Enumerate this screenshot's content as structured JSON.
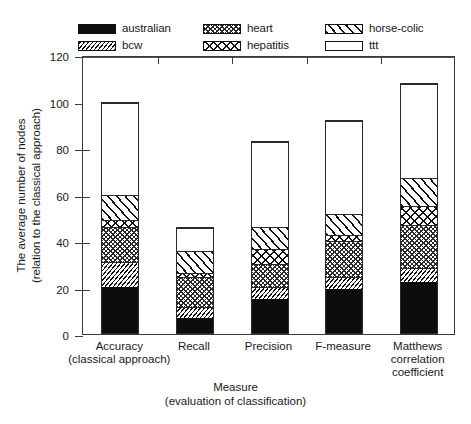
{
  "chart_data": {
    "type": "bar",
    "subtype": "stacked-bar",
    "title": "",
    "xlabel": "Measure (evaluation of classification)",
    "xlabel_lines": [
      "Measure",
      "(evaluation of classification)"
    ],
    "ylabel": "The average number of nodes (relation to the classical approach)",
    "ylabel_lines": [
      "The average number of nodes",
      "(relation to the classical approach)"
    ],
    "ylim": [
      0,
      120
    ],
    "yticks": [
      0,
      20,
      40,
      60,
      80,
      100,
      120
    ],
    "ytick_labels": [
      "0",
      "20",
      "40",
      "60",
      "80",
      "100",
      "120"
    ],
    "grid": false,
    "reference_line": 100,
    "legend_position": "above-plot",
    "categories": [
      "Accuracy (classical approach)",
      "Recall",
      "Precision",
      "F-measure",
      "Matthews correlation coefficient"
    ],
    "category_lines": [
      [
        "Accuracy",
        "(classical approach)"
      ],
      [
        "Recall"
      ],
      [
        "Precision"
      ],
      [
        "F-measure"
      ],
      [
        "Matthews",
        "correlation",
        "coefficient"
      ]
    ],
    "series": [
      {
        "name": "australian",
        "pattern": "solid-black",
        "values": [
          20,
          6.5,
          15,
          19,
          22
        ]
      },
      {
        "name": "bcw",
        "pattern": "diagonal-fine",
        "values": [
          11,
          5,
          5,
          5.5,
          6
        ]
      },
      {
        "name": "heart",
        "pattern": "crosshatch-fine",
        "values": [
          15,
          13,
          10,
          15.5,
          19
        ]
      },
      {
        "name": "hepatitis",
        "pattern": "crosshatch-coarse",
        "values": [
          3,
          2,
          6.5,
          2.5,
          8
        ]
      },
      {
        "name": "horse-colic",
        "pattern": "diagonal-coarse",
        "values": [
          11,
          9.5,
          9.5,
          9,
          12
        ]
      },
      {
        "name": "ttt",
        "pattern": "white-empty",
        "values": [
          40,
          10,
          37,
          40.5,
          41
        ]
      }
    ],
    "totals": [
      100,
      46,
      83,
      92,
      108
    ]
  },
  "legend": {
    "entries": [
      {
        "label": "australian",
        "swatch": "solid-black-swatch"
      },
      {
        "label": "bcw",
        "swatch": "diagonal-fine-swatch"
      },
      {
        "label": "heart",
        "swatch": "crosshatch-fine-swatch"
      },
      {
        "label": "hepatitis",
        "swatch": "crosshatch-coarse-swatch"
      },
      {
        "label": "horse-colic",
        "swatch": "diagonal-coarse-swatch"
      },
      {
        "label": "ttt",
        "swatch": "white-empty-swatch"
      }
    ]
  }
}
